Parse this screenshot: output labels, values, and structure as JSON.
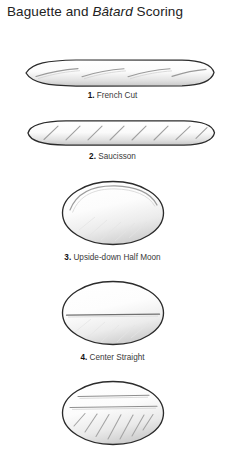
{
  "figure": {
    "title_prefix": "Baguette and ",
    "title_italic": "Bâtard",
    "title_suffix": " Scoring",
    "background_color": "#ffffff",
    "outline_color": "#2b2b2b",
    "score_line_color": "#8c8c8c",
    "caption_color": "#3a3a3a"
  },
  "items": [
    {
      "number": "1.",
      "label": "French Cut",
      "caption": "1. French Cut",
      "loaf_type": "baguette",
      "score_count": 4,
      "score_style": "long shallow diagonal slashes"
    },
    {
      "number": "2.",
      "label": "Saucisson",
      "caption": "2. Saucisson",
      "loaf_type": "baguette",
      "score_count": 8,
      "score_style": "short steep parallel slashes"
    },
    {
      "number": "3.",
      "label": "Upside-down Half Moon",
      "caption": "3. Upside-down Half Moon",
      "loaf_type": "batard",
      "score_count": 1,
      "score_style": "single curved arc near top"
    },
    {
      "number": "4.",
      "label": "Center Straight",
      "caption": "4. Center Straight",
      "loaf_type": "batard",
      "score_count": 1,
      "score_style": "single horizontal center line"
    },
    {
      "number": "5.",
      "label": "",
      "caption": "",
      "loaf_type": "batard",
      "score_count": 9,
      "score_style": "two horizontal lines above seven diagonal slashes"
    }
  ]
}
